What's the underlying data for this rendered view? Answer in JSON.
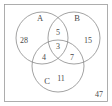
{
  "figure": {
    "type": "venn-diagram-3-set",
    "universe": {
      "outside_count": "47"
    },
    "sets": [
      {
        "id": "A",
        "label": "A",
        "only_count": "28"
      },
      {
        "id": "B",
        "label": "B",
        "only_count": "15"
      },
      {
        "id": "C",
        "label": "C",
        "only_count": "11"
      }
    ],
    "regions": {
      "a_only": "28",
      "b_only": "15",
      "c_only": "11",
      "a_and_b": "5",
      "a_and_c": "4",
      "b_and_c": "7",
      "a_and_b_and_c": "3"
    },
    "colors": {
      "circle_stroke": "#8a8a8a",
      "rect_stroke": "#9a9a9a",
      "text": "#4a4a4a",
      "background": "#ffffff"
    }
  }
}
